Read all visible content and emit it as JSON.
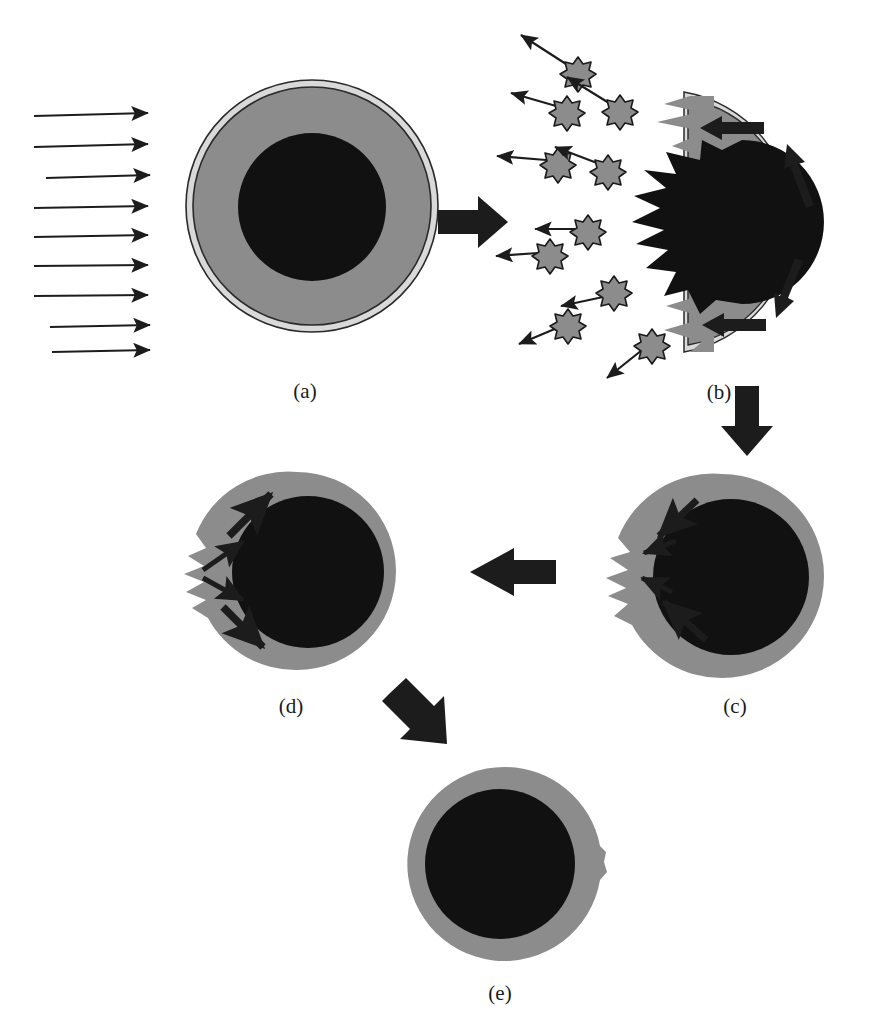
{
  "figure": {
    "background_color": "#ffffff",
    "shell_color": "#8c8c8c",
    "core_color": "#111111",
    "rim_color": "#d9d9d9",
    "outline_color": "#222222",
    "arrow_color": "#1c1c1c",
    "particle_fill": "#8c8c8c",
    "particle_stroke": "#1a1a1a"
  },
  "panels": [
    {
      "id": "a",
      "label": "(a)",
      "label_x": 305,
      "label_y": 398,
      "caption_note": "intact shell-and-core sphere with incident beam arrows",
      "center_x": 312,
      "center_y": 206,
      "outer_radius": 126,
      "rim_radius": 120,
      "core_radius": 74
    },
    {
      "id": "b",
      "label": "(b)",
      "label_x": 719,
      "label_y": 399,
      "caption_note": "ablated hemisphere with ejected particles and recoil arrows",
      "center_x": 710,
      "center_y": 222,
      "outer_radius": 132,
      "rim_radius": 126,
      "core_radius": 82
    },
    {
      "id": "c",
      "label": "(c)",
      "label_x": 735,
      "label_y": 713,
      "caption_note": "re-closed sphere with residual spike, arrows converging inward",
      "center_x": 722,
      "center_y": 576,
      "outer_radius": 102,
      "core_radius": 76
    },
    {
      "id": "d",
      "label": "(d)",
      "label_x": 291,
      "label_y": 713,
      "caption_note": "sphere with spike, arrows diverging outward",
      "center_x": 297,
      "center_y": 571,
      "outer_radius": 99,
      "core_radius": 74
    },
    {
      "id": "e",
      "label": "(e)",
      "label_x": 500,
      "label_y": 1000,
      "caption_note": "relaxed sphere with small residual bulge on right",
      "center_x": 505,
      "center_y": 864,
      "outer_radius": 97,
      "core_radius": 73
    }
  ],
  "incident_beam": {
    "name": "incident-beam-arrows",
    "count": 9,
    "direction": "right",
    "x_start": 34,
    "x_end": 150,
    "y_values": [
      116,
      146,
      176,
      206,
      236,
      266,
      296,
      326,
      352
    ],
    "x_start_offsets": [
      0,
      0,
      12,
      0,
      0,
      0,
      0,
      16,
      18
    ]
  },
  "transition_arrows": [
    {
      "name": "arrow-a-to-b",
      "from": "a",
      "to": "b",
      "direction": "right",
      "x": 438,
      "y": 222,
      "length": 66,
      "thickness": 24
    },
    {
      "name": "arrow-b-to-c",
      "from": "b",
      "to": "c",
      "direction": "down",
      "x": 746,
      "y": 388,
      "length": 68,
      "thickness": 24
    },
    {
      "name": "arrow-c-to-d",
      "from": "c",
      "to": "d",
      "direction": "left",
      "x": 552,
      "y": 571,
      "length": 82,
      "thickness": 26
    },
    {
      "name": "arrow-d-to-e",
      "from": "d",
      "to": "e",
      "direction": "down-right",
      "x": 386,
      "y": 697,
      "length": 64,
      "thickness": 24
    }
  ],
  "ejected_particles": [
    {
      "name": "particle-1",
      "cx": 578,
      "cy": 72,
      "r": 15,
      "arrow_to_x": 519,
      "arrow_to_y": 33
    },
    {
      "name": "particle-2",
      "cx": 620,
      "cy": 110,
      "r": 15,
      "arrow_to_x": 565,
      "arrow_to_y": 75
    },
    {
      "name": "particle_3",
      "cx": 567,
      "cy": 111,
      "r": 15,
      "arrow_to_x": 509,
      "arrow_to_y": 92
    },
    {
      "name": "particle-4",
      "cx": 558,
      "cy": 163,
      "r": 15,
      "arrow_to_x": 495,
      "arrow_to_y": 155
    },
    {
      "name": "particle-5",
      "cx": 608,
      "cy": 170,
      "r": 15,
      "arrow_to_x": 553,
      "arrow_to_y": 145
    },
    {
      "name": "particle-6",
      "cx": 588,
      "cy": 229,
      "r": 14,
      "arrow_to_x": 533,
      "arrow_to_y": 229
    },
    {
      "name": "particle-7",
      "cx": 550,
      "cy": 252,
      "r": 14,
      "arrow_to_x": 494,
      "arrow_to_y": 256
    },
    {
      "name": "particle-8",
      "cx": 614,
      "cy": 290,
      "r": 14,
      "arrow_to_x": 559,
      "arrow_to_y": 307
    },
    {
      "name": "particle-9",
      "cx": 568,
      "cy": 322,
      "r": 14,
      "arrow_to_x": 518,
      "arrow_to_y": 343
    },
    {
      "name": "particle-10",
      "cx": 652,
      "cy": 342,
      "r": 14,
      "arrow_to_x": 605,
      "arrow_to_y": 377
    }
  ],
  "panel_b_flow_arrows": [
    {
      "name": "recoil-arrow-top",
      "x1": 710,
      "y1": 128,
      "x2": 662,
      "y2": 128,
      "style": "straight-left"
    },
    {
      "name": "recoil-arrow-bottom",
      "x1": 712,
      "y1": 325,
      "x2": 664,
      "y2": 325,
      "style": "straight-left"
    },
    {
      "name": "circulation-arrow-upper",
      "x1": 797,
      "y1": 197,
      "x2": 782,
      "y2": 158,
      "style": "tangential-up"
    },
    {
      "name": "circulation-arrow-lower",
      "x1": 786,
      "y1": 265,
      "x2": 772,
      "y2": 302,
      "style": "tangential-down"
    }
  ],
  "panel_c_flow_arrows": [
    {
      "name": "inflow-arrow-upper",
      "x1": 692,
      "y1": 505,
      "x2": 655,
      "y2": 539
    },
    {
      "name": "inflow-arrow-mid-upper",
      "x1": 668,
      "y1": 545,
      "x2": 634,
      "y2": 557
    },
    {
      "name": "inflow-arrow-mid-lower",
      "x1": 664,
      "y1": 590,
      "x2": 634,
      "y2": 576
    },
    {
      "name": "inflow-arrow-lower",
      "x1": 700,
      "y1": 635,
      "x2": 660,
      "y2": 600
    }
  ],
  "panel_d_flow_arrows": [
    {
      "name": "outflow-arrow-upper",
      "x1": 235,
      "y1": 530,
      "x2": 273,
      "y2": 496
    },
    {
      "name": "outflow-arrow-mid-upper",
      "x1": 208,
      "y1": 568,
      "x2": 242,
      "y2": 545
    },
    {
      "name": "outflow-arrow-mid-lower",
      "x1": 208,
      "y1": 576,
      "x2": 242,
      "y2": 597
    },
    {
      "name": "outflow-arrow-lower",
      "x1": 228,
      "y1": 611,
      "x2": 262,
      "y2": 645
    }
  ]
}
